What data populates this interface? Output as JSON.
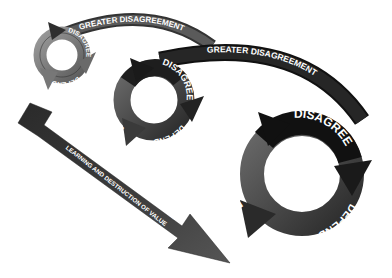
{
  "diagram": {
    "colors": {
      "background": "#ffffff",
      "dark": "#1e1e1e",
      "mid": "#4a4a4a",
      "light": "#8a8a8a",
      "text": "#ffffff"
    },
    "cycles": [
      {
        "id": "small",
        "labels": {
          "destroy": "DESTROY",
          "disagree": "DISAGREE",
          "defend": "DEFEND"
        }
      },
      {
        "id": "medium",
        "labels": {
          "destroy": "DESTROY",
          "disagree": "DISAGREE",
          "defend": "DEFEND"
        }
      },
      {
        "id": "large",
        "labels": {
          "destroy": "DESTROY",
          "disagree": "DISAGREE",
          "defend": "DEFEND"
        }
      }
    ],
    "connectors": [
      {
        "id": "small-to-medium",
        "label": "GREATER DISAGREEMENT"
      },
      {
        "id": "medium-to-large",
        "label": "GREATER DISAGREEMENT"
      }
    ],
    "trend_arrow": {
      "line1": "DETERIORATING RELATIONSHIPS, DECREASED",
      "line2": "LEARNING AND DESTRUCTION OF VALUE"
    }
  }
}
